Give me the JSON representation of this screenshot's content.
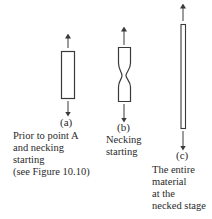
{
  "figure": {
    "panels": [
      {
        "id": "a",
        "label": "(a)",
        "caption": [
          "Prior to point A",
          "and necking",
          "starting",
          "(see Figure 10.10)"
        ],
        "shape": "uniform-rectangle"
      },
      {
        "id": "b",
        "label": "(b)",
        "caption": [
          "Necking",
          "starting"
        ],
        "shape": "necked-specimen"
      },
      {
        "id": "c",
        "label": "(c)",
        "caption": [
          "The entire",
          "material",
          "at the",
          "necked stage"
        ],
        "shape": "thin-elongated-rectangle"
      }
    ],
    "colors": {
      "stroke": "#3a3a3a",
      "background": "#ffffff",
      "text": "#2a2a2a"
    }
  }
}
